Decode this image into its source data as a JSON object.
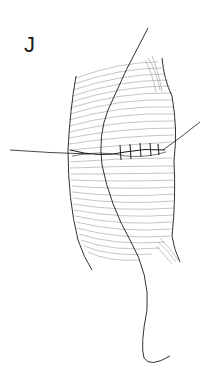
{
  "figure": {
    "panel_label": "J",
    "colors": {
      "background": "#ffffff",
      "ink": "#1a1a1a",
      "hatch": "#8a8a8a"
    }
  }
}
